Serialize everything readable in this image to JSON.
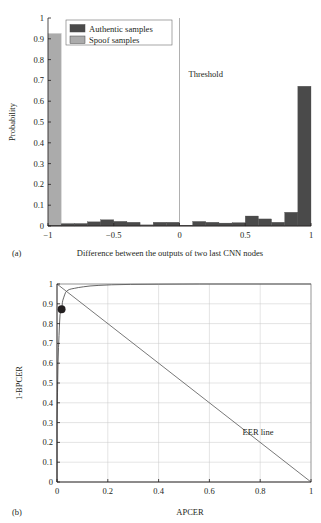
{
  "page": {
    "background": "#ffffff",
    "text_color": "#231f20"
  },
  "colors": {
    "authentic": "#4a4a4a",
    "spoof": "#ababab",
    "axis": "#231f20",
    "grid": "#c9c9c9",
    "curve": "#555555"
  },
  "figure_a": {
    "caption": "(a)",
    "legend": {
      "items": [
        {
          "label": "Authentic samples",
          "color": "#4a4a4a"
        },
        {
          "label": "Spoof samples",
          "color": "#ababab"
        }
      ]
    },
    "annotation": {
      "text": "Threshold",
      "x": 0.0
    },
    "chart_data": {
      "type": "bar",
      "title": "",
      "xlabel": "Difference between the outputs of two last CNN nodes",
      "ylabel": "Probability",
      "xlim": [
        -1,
        1
      ],
      "ylim": [
        0,
        1
      ],
      "xticks": [
        -1,
        -0.5,
        0,
        0.5,
        1
      ],
      "xtick_labels": [
        "−1",
        "−0.5",
        "0",
        "0.5",
        "1"
      ],
      "yticks": [
        0,
        0.1,
        0.2,
        0.3,
        0.4,
        0.5,
        0.6,
        0.7,
        0.8,
        0.9,
        1
      ],
      "ytick_labels": [
        "0",
        "0.1",
        "0.2",
        "0.3",
        "0.4",
        "0.5",
        "0.6",
        "0.7",
        "0.8",
        "0.9",
        "1"
      ],
      "grid": false,
      "bin_edges": [
        -1.0,
        -0.9,
        -0.8,
        -0.7,
        -0.6,
        -0.5,
        -0.4,
        -0.3,
        -0.2,
        -0.1,
        0.0,
        0.1,
        0.2,
        0.3,
        0.4,
        0.5,
        0.6,
        0.7,
        0.8,
        0.9,
        1.0
      ],
      "series": [
        {
          "name": "Spoof samples",
          "color": "#ababab",
          "values": [
            0.925,
            0.014,
            0.008,
            0.012,
            0.016,
            0.02,
            0.014,
            0.008,
            0.004,
            0.004,
            0.004,
            0.004,
            0.004,
            0.004,
            0.004,
            0.004,
            0.004,
            0.004,
            0.004,
            0.006
          ]
        },
        {
          "name": "Authentic samples",
          "color": "#4a4a4a",
          "values": [
            0.004,
            0.01,
            0.012,
            0.02,
            0.03,
            0.022,
            0.018,
            0.004,
            0.018,
            0.018,
            0.004,
            0.022,
            0.018,
            0.014,
            0.016,
            0.048,
            0.034,
            0.018,
            0.066,
            0.672
          ]
        }
      ]
    }
  },
  "figure_b": {
    "caption": "(b)",
    "annotation": {
      "text": "EER line"
    },
    "chart_data": {
      "type": "line",
      "title": "",
      "xlabel": "APCER",
      "ylabel": "1-BPCER",
      "xlim": [
        0,
        1
      ],
      "ylim": [
        0,
        1
      ],
      "xticks": [
        0,
        0.2,
        0.4,
        0.6,
        0.8,
        1
      ],
      "xtick_labels": [
        "0",
        "0.2",
        "0.4",
        "0.6",
        "0.8",
        "1"
      ],
      "yticks": [
        0,
        0.1,
        0.2,
        0.3,
        0.4,
        0.5,
        0.6,
        0.7,
        0.8,
        0.9,
        1
      ],
      "ytick_labels": [
        "0",
        "0.1",
        "0.2",
        "0.3",
        "0.4",
        "0.5",
        "0.6",
        "0.7",
        "0.8",
        "0.9",
        "1"
      ],
      "grid": true,
      "series": [
        {
          "name": "ROC curve",
          "color": "#555555",
          "points": [
            [
              0.0,
              0.0
            ],
            [
              0.0,
              0.3
            ],
            [
              0.002,
              0.45
            ],
            [
              0.003,
              0.52
            ],
            [
              0.004,
              0.6
            ],
            [
              0.006,
              0.68
            ],
            [
              0.008,
              0.74
            ],
            [
              0.01,
              0.8
            ],
            [
              0.012,
              0.845
            ],
            [
              0.016,
              0.87
            ],
            [
              0.018,
              0.875
            ],
            [
              0.02,
              0.885
            ],
            [
              0.021,
              0.905
            ],
            [
              0.023,
              0.918
            ],
            [
              0.026,
              0.93
            ],
            [
              0.03,
              0.945
            ],
            [
              0.034,
              0.958
            ],
            [
              0.04,
              0.966
            ],
            [
              0.048,
              0.972
            ],
            [
              0.056,
              0.975
            ],
            [
              0.068,
              0.978
            ],
            [
              0.084,
              0.982
            ],
            [
              0.105,
              0.986
            ],
            [
              0.13,
              0.99
            ],
            [
              0.165,
              0.993
            ],
            [
              0.215,
              0.996
            ],
            [
              0.29,
              0.998
            ],
            [
              0.4,
              0.999
            ],
            [
              0.56,
              1.0
            ],
            [
              1.0,
              1.0
            ]
          ]
        },
        {
          "name": "EER line",
          "color": "#555555",
          "points": [
            [
              0.0,
              1.0
            ],
            [
              1.0,
              0.0
            ]
          ]
        }
      ],
      "markers": [
        {
          "name": "eer-operating-point",
          "x": 0.018,
          "y": 0.872,
          "color": "#231f20",
          "radius": 4.0
        }
      ]
    }
  }
}
